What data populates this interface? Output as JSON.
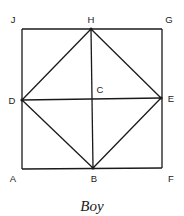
{
  "caption": "Boy",
  "colors": {
    "line": "#1a1a1a",
    "background": "#ffffff"
  },
  "points": {
    "J": {
      "label": "J",
      "x": 22,
      "y": 29
    },
    "H": {
      "label": "H",
      "x": 91,
      "y": 29
    },
    "G": {
      "label": "G",
      "x": 162,
      "y": 29
    },
    "D": {
      "label": "D",
      "x": 22,
      "y": 100
    },
    "C": {
      "label": "C",
      "x": 92,
      "y": 99
    },
    "E": {
      "label": "E",
      "x": 161,
      "y": 98
    },
    "A": {
      "label": "A",
      "x": 22,
      "y": 169
    },
    "B": {
      "label": "B",
      "x": 93,
      "y": 168
    },
    "F": {
      "label": "F",
      "x": 162,
      "y": 168
    }
  },
  "segments": [
    [
      "J",
      "G"
    ],
    [
      "G",
      "F"
    ],
    [
      "F",
      "A"
    ],
    [
      "A",
      "J"
    ],
    [
      "H",
      "E"
    ],
    [
      "E",
      "B"
    ],
    [
      "B",
      "D"
    ],
    [
      "D",
      "H"
    ],
    [
      "H",
      "B"
    ],
    [
      "D",
      "E"
    ]
  ],
  "label_positions": {
    "J": {
      "x": 13,
      "y": 23
    },
    "H": {
      "x": 91,
      "y": 23
    },
    "G": {
      "x": 169,
      "y": 23
    },
    "C": {
      "x": 100,
      "y": 93
    },
    "D": {
      "x": 12,
      "y": 104
    },
    "E": {
      "x": 171,
      "y": 102
    },
    "A": {
      "x": 13,
      "y": 182
    },
    "B": {
      "x": 94,
      "y": 182
    },
    "F": {
      "x": 171,
      "y": 182
    }
  }
}
